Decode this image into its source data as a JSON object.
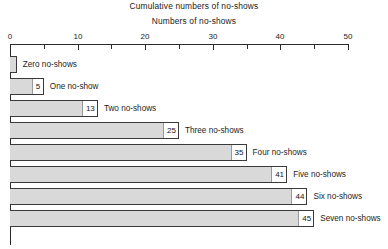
{
  "chart_data": {
    "type": "bar",
    "orientation": "horizontal",
    "title": "Cumulative numbers of no-shows",
    "xlabel": "Numbers of no-shows",
    "ylabel": "",
    "xlim": [
      0,
      50
    ],
    "grid": false,
    "legend": null,
    "tick_interval_major": 10,
    "tick_interval_minor": 5,
    "tick_labels": [
      "0",
      "10",
      "20",
      "30",
      "40",
      "50"
    ],
    "tick_values": [
      0,
      10,
      20,
      30,
      40,
      50
    ],
    "minor_tick_values": [
      5,
      15,
      25,
      35,
      45
    ],
    "categories": [
      "Zero no-shows",
      "One no-show",
      "Two no-shows",
      "Three no-shows",
      "Four no-shows",
      "Five no-shows",
      "Six no-shows",
      "Seven no-shows"
    ],
    "values": [
      1,
      5,
      13,
      25,
      35,
      41,
      44,
      45
    ],
    "data_labels": [
      "",
      "5",
      "13",
      "25",
      "35",
      "41",
      "44",
      "45"
    ],
    "bar_fill_color": "#d9d9d9",
    "bar_border_color": "#3a3a3a",
    "axis_color": "#2b2b2b"
  },
  "bars": [
    {
      "label": "Zero no-shows",
      "value_text": "",
      "value": 1
    },
    {
      "label": "One no-show",
      "value_text": "5",
      "value": 5
    },
    {
      "label": "Two no-shows",
      "value_text": "13",
      "value": 13
    },
    {
      "label": "Three no-shows",
      "value_text": "25",
      "value": 25
    },
    {
      "label": "Four no-shows",
      "value_text": "35",
      "value": 35
    },
    {
      "label": "Five no-shows",
      "value_text": "41",
      "value": 41
    },
    {
      "label": "Six no-shows",
      "value_text": "44",
      "value": 44
    },
    {
      "label": "Seven no-shows",
      "value_text": "45",
      "value": 45
    }
  ]
}
